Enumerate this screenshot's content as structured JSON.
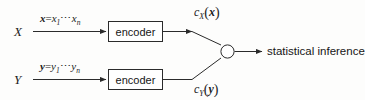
{
  "diagram": {
    "background_color": "#fdfdfc",
    "line_color": "#2b2b2b",
    "text_color": "#1b1b1b",
    "sources": [
      {
        "id": "x",
        "label": "X"
      },
      {
        "id": "y",
        "label": "Y"
      }
    ],
    "input_edges": [
      {
        "id": "x-input",
        "var": "x",
        "equals": "=",
        "first": "x",
        "first_sub": "1",
        "dots": "⋯",
        "last": "x",
        "last_sub": "n",
        "full_text": "x = x₁ ⋯ xₙ"
      },
      {
        "id": "y-input",
        "var": "y",
        "equals": "=",
        "first": "y",
        "first_sub": "1",
        "dots": "⋯",
        "last": "y",
        "last_sub": "n",
        "full_text": "y = y₁ ⋯ yₙ"
      }
    ],
    "encoders": [
      {
        "id": "encoder-x",
        "label": "encoder"
      },
      {
        "id": "encoder-y",
        "label": "encoder"
      }
    ],
    "code_labels": [
      {
        "id": "code-x",
        "fn": "c",
        "sub": "X",
        "open": "(",
        "arg": "x",
        "close": ")",
        "full_text": "c_X (x)"
      },
      {
        "id": "code-y",
        "fn": "c",
        "sub": "Y",
        "open": "(",
        "arg": "y",
        "close": ")",
        "full_text": "c_Y (y)"
      }
    ],
    "junction": {
      "id": "junction-node",
      "shape": "circle",
      "fill": "#ffffff",
      "stroke": "#2b2b2b"
    },
    "output": {
      "id": "output-label",
      "label": "statistical inference"
    }
  }
}
